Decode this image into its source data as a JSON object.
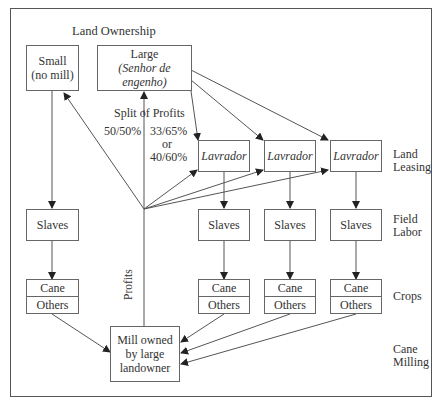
{
  "title": "Land Ownership",
  "owners": {
    "small": {
      "line1": "Small",
      "line2": "(no mill)"
    },
    "large": {
      "line1": "Large",
      "line2": "(Senhor de engenho)"
    }
  },
  "split": {
    "title": "Split of Profits",
    "left": "50/50%",
    "right1": "33/65%",
    "or": "or",
    "right2": "40/60%"
  },
  "lavradores": [
    "Lavrador",
    "Lavrador",
    "Lavrador"
  ],
  "slaves": [
    "Slaves",
    "Slaves",
    "Slaves",
    "Slaves"
  ],
  "crops": [
    {
      "top": "Cane",
      "bottom": "Others"
    },
    {
      "top": "Cane",
      "bottom": "Others"
    },
    {
      "top": "Cane",
      "bottom": "Others"
    },
    {
      "top": "Cane",
      "bottom": "Others"
    }
  ],
  "profits_label": "Profits",
  "mill": {
    "line1": "Mill owned",
    "line2": "by large",
    "line3": "landowner"
  },
  "rows": {
    "land_leasing": [
      "Land",
      "Leasing"
    ],
    "field_labor": [
      "Field",
      "Labor"
    ],
    "crops": "Crops",
    "cane_milling": [
      "Cane",
      "Milling"
    ]
  }
}
